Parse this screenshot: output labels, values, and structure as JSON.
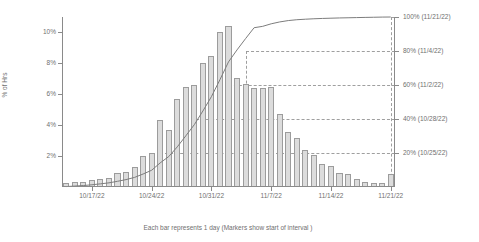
{
  "chart_data": {
    "type": "bar",
    "title": "",
    "subtitle": "",
    "xlabel": "Each bar represents 1 day  (Markers show start of interval )",
    "ylabel": "% of Hrs",
    "ylim": [
      0,
      11
    ],
    "grid": false,
    "legend": null,
    "x_tick_labels": [
      "10/17/22",
      "10/24/22",
      "10/31/22",
      "11/7/22",
      "11/14/22",
      "11/21/22"
    ],
    "x_tick_positions_day_index": [
      3,
      10,
      17,
      24,
      31,
      38
    ],
    "y_tick_labels": [
      "2%",
      "4%",
      "6%",
      "8%",
      "10%"
    ],
    "y_tick_values": [
      2,
      4,
      6,
      8,
      10
    ],
    "secondary_axis": {
      "label": "Cumulative %",
      "tick_labels": [
        "20% (10/25/22)",
        "40% (10/28/22)",
        "60% (11/2/22)",
        "80% (11/4/22)",
        "100% (11/21/22)"
      ],
      "tick_values": [
        20,
        40,
        60,
        80,
        100
      ],
      "marker_dates": [
        "10/25/22",
        "10/28/22",
        "11/2/22",
        "11/4/22",
        "11/21/22"
      ],
      "marker_day_index": [
        11,
        14,
        19,
        21,
        38
      ]
    },
    "categories": [
      "10/14/22",
      "10/15/22",
      "10/16/22",
      "10/17/22",
      "10/18/22",
      "10/19/22",
      "10/20/22",
      "10/21/22",
      "10/22/22",
      "10/23/22",
      "10/24/22",
      "10/25/22",
      "10/26/22",
      "10/27/22",
      "10/28/22",
      "10/29/22",
      "10/30/22",
      "10/31/22",
      "11/1/22",
      "11/2/22",
      "11/3/22",
      "11/4/22",
      "11/5/22",
      "11/6/22",
      "11/7/22",
      "11/8/22",
      "11/9/22",
      "11/10/22",
      "11/11/22",
      "11/12/22",
      "11/13/22",
      "11/14/22",
      "11/15/22",
      "11/16/22",
      "11/17/22",
      "11/18/22",
      "11/19/22",
      "11/20/22",
      "11/21/22"
    ],
    "values": [
      0.25,
      0.3,
      0.3,
      0.45,
      0.55,
      0.6,
      0.9,
      1.0,
      1.3,
      2.0,
      2.2,
      4.35,
      3.7,
      5.7,
      6.5,
      6.6,
      8.0,
      8.45,
      10.0,
      10.45,
      7.05,
      6.65,
      6.4,
      6.4,
      6.45,
      4.75,
      3.55,
      3.15,
      2.4,
      2.05,
      1.5,
      1.35,
      0.9,
      0.85,
      0.55,
      0.3,
      0.25,
      0.25,
      0.85
    ],
    "cumulative_values": [
      0.25,
      0.55,
      0.85,
      1.3,
      1.85,
      2.45,
      3.35,
      4.35,
      5.65,
      7.65,
      9.85,
      14.2,
      17.9,
      23.6,
      30.1,
      36.7,
      44.7,
      53.15,
      63.15,
      73.6,
      80.65,
      87.3,
      93.7,
      94.5,
      96.0,
      97.1,
      97.9,
      98.4,
      98.7,
      98.95,
      99.15,
      99.3,
      99.45,
      99.55,
      99.65,
      99.75,
      99.85,
      99.95,
      100.0
    ],
    "colors": {
      "bar_fill": "#dcdcdc",
      "bar_stroke": "#9c9c9c",
      "curve": "#7d7d7d",
      "axis": "#8a8a8a",
      "grid_dash": "#9a9a9a",
      "text": "#6f6f6f",
      "background": "#ffffff"
    }
  }
}
